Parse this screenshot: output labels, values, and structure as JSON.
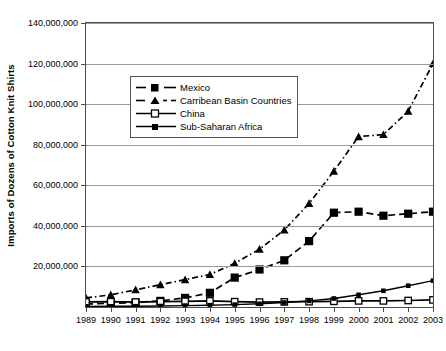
{
  "chart_data": {
    "type": "line",
    "title": "",
    "xlabel": "",
    "ylabel": "Imports of Dozens of Cotton Knit Shirts",
    "categories": [
      1989,
      1990,
      1991,
      1992,
      1993,
      1994,
      1995,
      1996,
      1997,
      1998,
      1999,
      2000,
      2001,
      2002,
      2003
    ],
    "x_tick_labels": [
      "1989",
      "1990",
      "1991",
      "1992",
      "1993",
      "1994",
      "1995",
      "1996",
      "1997",
      "1998",
      "1999",
      "2000",
      "2001",
      "2002",
      "2003"
    ],
    "y_tick_labels": [
      "140,000,000",
      "120,000,000",
      "100,000,000",
      "80,000,000",
      "60,000,000",
      "40,000,000",
      "20,000,000"
    ],
    "y_ticks": [
      140000000,
      120000000,
      100000000,
      80000000,
      60000000,
      40000000,
      20000000
    ],
    "ylim": [
      0,
      140000000
    ],
    "xlim": [
      1989,
      2003
    ],
    "grid": true,
    "legend_position": "upper-left-inside",
    "series": [
      {
        "name": "Mexico",
        "marker": "filled-square",
        "linestyle": "dashed",
        "color": "#000000",
        "values": [
          1500000,
          1800000,
          2200000,
          3000000,
          4500000,
          7000000,
          14500000,
          18500000,
          23000000,
          32500000,
          46500000,
          47000000,
          45000000,
          46000000,
          47000000
        ]
      },
      {
        "name": "Carribean Basin Countries",
        "marker": "filled-triangle",
        "linestyle": "dash-dot",
        "color": "#000000",
        "values": [
          4500000,
          6000000,
          8500000,
          11000000,
          13500000,
          16000000,
          21500000,
          28500000,
          38000000,
          51000000,
          67000000,
          84000000,
          85000000,
          96500000,
          120000000
        ]
      },
      {
        "name": "China",
        "marker": "open-square",
        "linestyle": "solid",
        "color": "#000000",
        "values": [
          2500000,
          2600000,
          2400000,
          2600000,
          2800000,
          3000000,
          2600000,
          2400000,
          2500000,
          2600000,
          2800000,
          3000000,
          3000000,
          3200000,
          3500000
        ]
      },
      {
        "name": "Sub-Saharan Africa",
        "marker": "small-filled-square",
        "linestyle": "solid",
        "color": "#000000",
        "values": [
          300000,
          350000,
          400000,
          500000,
          700000,
          900000,
          1200000,
          1600000,
          2200000,
          3000000,
          4200000,
          6000000,
          8000000,
          10500000,
          13000000
        ]
      }
    ]
  },
  "legend": {
    "items": [
      {
        "label": "Mexico"
      },
      {
        "label": "Carribean Basin Countries"
      },
      {
        "label": "China"
      },
      {
        "label": "Sub-Saharan Africa"
      }
    ]
  },
  "axis": {
    "y_title": "Imports of Dozens of Cotton Knit Shirts"
  },
  "colors": {
    "line": "#000000",
    "grid": "#9a9a9a",
    "frame": "#4d4d4d",
    "background": "#ffffff"
  }
}
